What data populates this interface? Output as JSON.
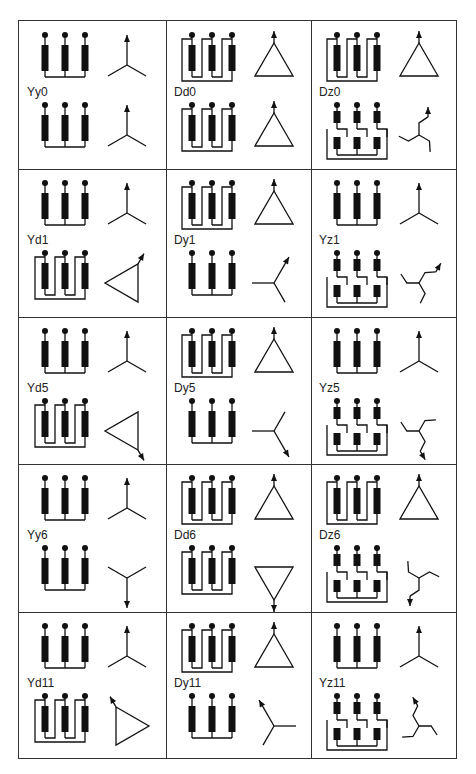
{
  "figure": {
    "grid": {
      "rows": 5,
      "cols": 3
    },
    "terminal_labels": {
      "hv": [
        "I",
        "II",
        "III"
      ],
      "lv": [
        "i",
        "ii",
        "iii"
      ],
      "hv_phasor": {
        "top": "I",
        "left": "III",
        "right": "II"
      },
      "lv_phasor": {
        "top": "i",
        "left": "iii",
        "right": "ii"
      }
    },
    "cells": [
      {
        "label": "Yy0",
        "hv": "Y",
        "lv": "y",
        "hv_angle": 0,
        "lv_angle": 0
      },
      {
        "label": "Dd0",
        "hv": "D",
        "lv": "d",
        "hv_angle": 0,
        "lv_angle": 0
      },
      {
        "label": "Dz0",
        "hv": "D",
        "lv": "z",
        "hv_angle": 0,
        "lv_angle": 0
      },
      {
        "label": "Yd1",
        "hv": "Y",
        "lv": "d",
        "hv_angle": 0,
        "lv_angle": 30
      },
      {
        "label": "Dy1",
        "hv": "D",
        "lv": "y",
        "hv_angle": 0,
        "lv_angle": 30
      },
      {
        "label": "Yz1",
        "hv": "Y",
        "lv": "z",
        "hv_angle": 0,
        "lv_angle": 30
      },
      {
        "label": "Yd5",
        "hv": "Y",
        "lv": "d",
        "hv_angle": 0,
        "lv_angle": 150
      },
      {
        "label": "Dy5",
        "hv": "D",
        "lv": "y",
        "hv_angle": 0,
        "lv_angle": 150
      },
      {
        "label": "Yz5",
        "hv": "Y",
        "lv": "z",
        "hv_angle": 0,
        "lv_angle": 150
      },
      {
        "label": "Yy6",
        "hv": "Y",
        "lv": "y",
        "hv_angle": 0,
        "lv_angle": 180
      },
      {
        "label": "Dd6",
        "hv": "D",
        "lv": "d",
        "hv_angle": 0,
        "lv_angle": 180
      },
      {
        "label": "Dz6",
        "hv": "D",
        "lv": "z",
        "hv_angle": 0,
        "lv_angle": 180
      },
      {
        "label": "Yd11",
        "hv": "Y",
        "lv": "d",
        "hv_angle": 0,
        "lv_angle": -30
      },
      {
        "label": "Dy11",
        "hv": "D",
        "lv": "y",
        "hv_angle": 0,
        "lv_angle": -30
      },
      {
        "label": "Yz11",
        "hv": "Y",
        "lv": "z",
        "hv_angle": 0,
        "lv_angle": -30
      }
    ]
  }
}
